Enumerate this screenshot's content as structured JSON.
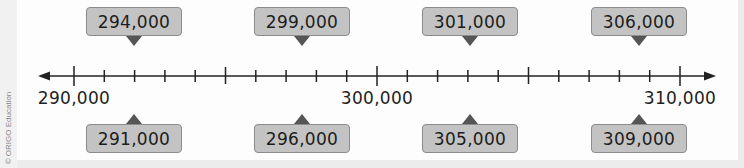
{
  "copyright": "© ORIGO Education",
  "number_line": {
    "start": 290000,
    "end": 310000,
    "step": 1000,
    "labels": [
      "290,000",
      "300,000",
      "310,000"
    ]
  },
  "callouts_top": [
    "294,000",
    "299,000",
    "301,000",
    "306,000"
  ],
  "callouts_bottom": [
    "291,000",
    "296,000",
    "305,000",
    "309,000"
  ],
  "colors": {
    "callout_fill": "#c3c3c3",
    "callout_border": "#8c8c8c",
    "pointer": "#555555",
    "line": "#222222"
  }
}
